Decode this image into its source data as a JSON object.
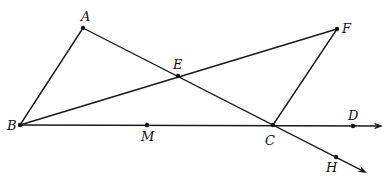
{
  "figure": {
    "type": "geometry-diagram",
    "width": 392,
    "height": 185,
    "stroke_color": "#1a1a1a",
    "background": "#ffffff"
  },
  "points": {
    "A": {
      "label": "A",
      "x": 83,
      "y": 28,
      "label_x": 81,
      "label_y": 21
    },
    "E": {
      "label": "E",
      "x": 178,
      "y": 76,
      "label_x": 173,
      "label_y": 69
    },
    "F": {
      "label": "F",
      "x": 337,
      "y": 29,
      "label_x": 342,
      "label_y": 33
    },
    "B": {
      "label": "B",
      "x": 20,
      "y": 125,
      "label_x": 7,
      "label_y": 130
    },
    "M": {
      "label": "M",
      "x": 147,
      "y": 125,
      "label_x": 141,
      "label_y": 141
    },
    "C": {
      "label": "C",
      "x": 273,
      "y": 125,
      "label_x": 265,
      "label_y": 145
    },
    "D": {
      "label": "D",
      "x": 353,
      "y": 126,
      "label_x": 348,
      "label_y": 120
    },
    "H": {
      "label": "H",
      "x": 336,
      "y": 157,
      "label_x": 326,
      "label_y": 172
    }
  },
  "segments": [
    {
      "name": "segment-ab",
      "from": "A",
      "to": "B"
    },
    {
      "name": "segment-bf",
      "from": "B",
      "to": "F"
    },
    {
      "name": "segment-fc",
      "from": "F",
      "to": "C"
    }
  ],
  "rays": [
    {
      "name": "ray-bd",
      "from": "B",
      "through": "D",
      "end_x": 383,
      "end_y": 126
    },
    {
      "name": "ray-ah",
      "from": "A",
      "through": "H",
      "end_x": 367,
      "end_y": 173
    }
  ]
}
